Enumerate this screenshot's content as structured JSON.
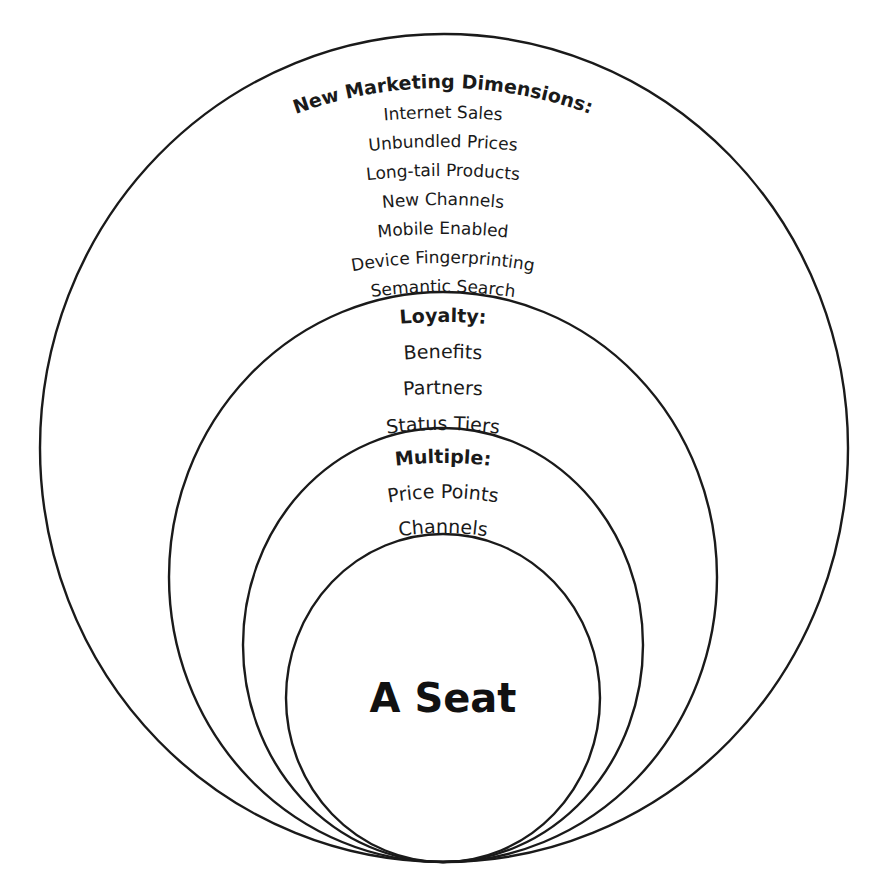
{
  "diagram": {
    "rings": [
      {
        "id": "outer",
        "heading": "New Marketing Dimensions:",
        "items": [
          "Internet Sales",
          "Unbundled Prices",
          "Long-tail Products",
          "New Channels",
          "Mobile Enabled",
          "Device Fingerprinting",
          "Semantic Search"
        ]
      },
      {
        "id": "loyalty",
        "heading": "Loyalty:",
        "items": [
          "Benefits",
          "Partners",
          "Status Tiers"
        ]
      },
      {
        "id": "multiple",
        "heading": "Multiple:",
        "items": [
          "Price Points",
          "Channels"
        ]
      },
      {
        "id": "core",
        "heading": "A Seat",
        "items": []
      }
    ],
    "colors": {
      "stroke": "#1a1a1a",
      "background": "#ffffff"
    }
  }
}
